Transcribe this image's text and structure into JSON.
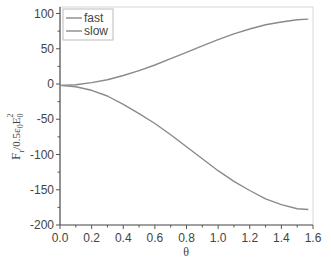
{
  "chart_data": {
    "type": "line",
    "title": "",
    "xlabel": "θ",
    "ylabel": "F_r/0.5ε_0E_0^2",
    "ylabel_parts": {
      "main": "F",
      "sub1": "r",
      "mid": "/0.5ε",
      "sub2": "0",
      "e": "E",
      "sub3": "0",
      "sup": "2"
    },
    "xlim": [
      0.0,
      1.6
    ],
    "ylim": [
      -200,
      100
    ],
    "xticks": [
      "0.0",
      "0.2",
      "0.4",
      "0.6",
      "0.8",
      "1.0",
      "1.2",
      "1.4",
      "1.6"
    ],
    "yticks": [
      "100",
      "50",
      "0",
      "-50",
      "-100",
      "-150",
      "-200"
    ],
    "grid": false,
    "legend_position": "upper left",
    "x": [
      0.0,
      0.1,
      0.2,
      0.3,
      0.4,
      0.5,
      0.6,
      0.7,
      0.8,
      0.9,
      1.0,
      1.1,
      1.2,
      1.3,
      1.4,
      1.5,
      1.57
    ],
    "series": [
      {
        "name": "fast",
        "color": "#8a8a8a",
        "values": [
          -2,
          -1,
          2,
          6,
          12,
          19,
          27,
          36,
          45,
          54,
          63,
          71,
          78,
          84,
          88,
          91,
          92
        ]
      },
      {
        "name": "slow",
        "color": "#8a8a8a",
        "values": [
          -2,
          -4,
          -9,
          -17,
          -29,
          -42,
          -56,
          -72,
          -89,
          -106,
          -123,
          -138,
          -151,
          -163,
          -171,
          -177,
          -178
        ]
      }
    ]
  },
  "legend": {
    "items": [
      {
        "label": "fast"
      },
      {
        "label": "slow"
      }
    ]
  }
}
